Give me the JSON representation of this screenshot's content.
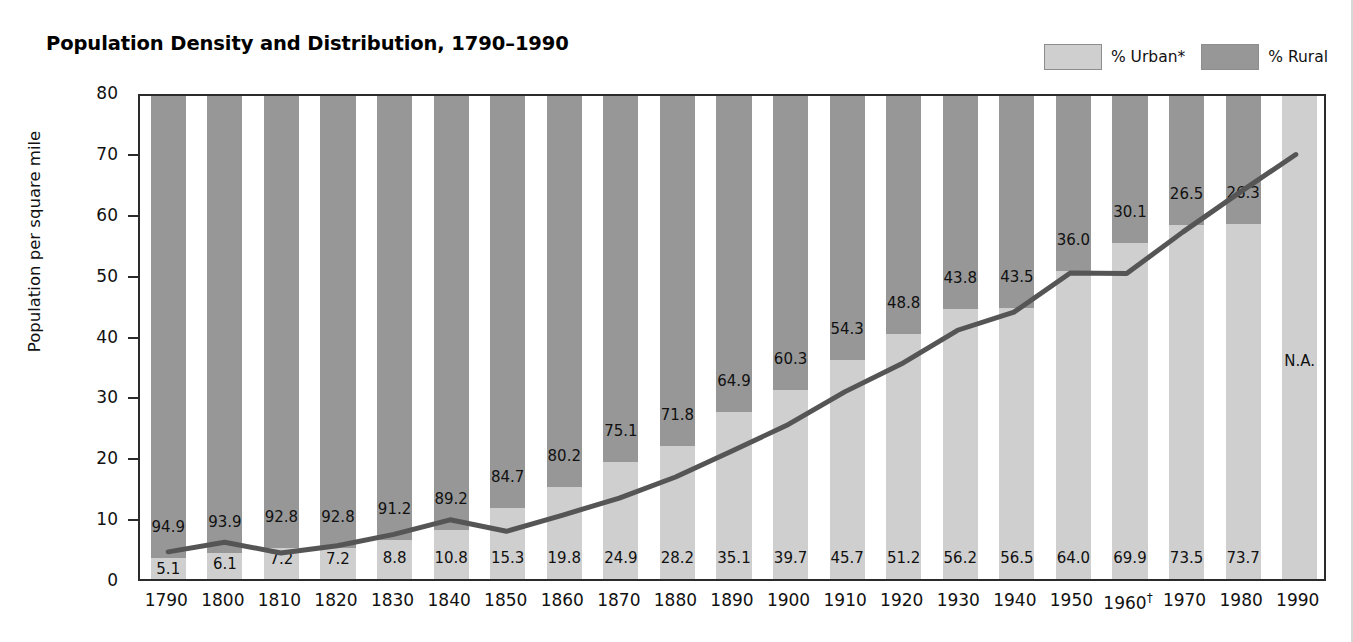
{
  "title": "Population Density and Distribution, 1790–1990",
  "legend": [
    {
      "label": "% Urban*",
      "color": "#cfcfcf",
      "name": "urban"
    },
    {
      "label": "% Rural",
      "color": "#979797",
      "name": "rural"
    }
  ],
  "axes": {
    "ylabel": "Population per square mile",
    "yticks": [
      "0",
      "10",
      "20",
      "30",
      "40",
      "50",
      "60",
      "70",
      "80"
    ],
    "ylim": [
      0,
      80
    ],
    "xlabel": ""
  },
  "na_label": "N.A.",
  "dagger": "†",
  "colors": {
    "urban": "#cfcfcf",
    "rural": "#979797",
    "line": "#555555",
    "frame": "#2b2b2b",
    "text": "#111111"
  },
  "chart_data": {
    "type": "bar",
    "title": "Population Density and Distribution, 1790–1990",
    "xlabel": "",
    "ylabel": "Population per square mile",
    "ylim": [
      0,
      80
    ],
    "grid": false,
    "legend_position": "top-right",
    "notes": [
      "* % Urban",
      "† 1960 footnote marker"
    ],
    "categories": [
      "1790",
      "1800",
      "1810",
      "1820",
      "1830",
      "1840",
      "1850",
      "1860",
      "1870",
      "1880",
      "1890",
      "1900",
      "1910",
      "1920",
      "1930",
      "1940",
      "1950",
      "1960",
      "1970",
      "1980",
      "1990"
    ],
    "series": [
      {
        "name": "% Urban*",
        "type": "bar-stacked-bottom",
        "color": "#cfcfcf",
        "values": [
          5.1,
          6.1,
          7.2,
          7.2,
          8.8,
          10.8,
          15.3,
          19.8,
          24.9,
          28.2,
          35.1,
          39.7,
          45.7,
          51.2,
          56.2,
          56.5,
          64.0,
          69.9,
          73.5,
          73.7,
          null
        ],
        "labels": [
          "5.1",
          "6.1",
          "7.2",
          "7.2",
          "8.8",
          "10.8",
          "15.3",
          "19.8",
          "24.9",
          "28.2",
          "35.1",
          "39.7",
          "45.7",
          "51.2",
          "56.2",
          "56.5",
          "64.0",
          "69.9",
          "73.5",
          "73.7",
          "N.A."
        ]
      },
      {
        "name": "% Rural",
        "type": "bar-stacked-top",
        "color": "#979797",
        "values": [
          94.9,
          93.9,
          92.8,
          92.8,
          91.2,
          89.2,
          84.7,
          80.2,
          75.1,
          71.8,
          64.9,
          60.3,
          54.3,
          48.8,
          43.8,
          43.5,
          36.0,
          30.1,
          26.5,
          26.3,
          null
        ],
        "labels": [
          "94.9",
          "93.9",
          "92.8",
          "92.8",
          "91.2",
          "89.2",
          "84.7",
          "80.2",
          "75.1",
          "71.8",
          "64.9",
          "60.3",
          "54.3",
          "48.8",
          "43.8",
          "43.5",
          "36.0",
          "30.1",
          "26.5",
          "26.3",
          ""
        ]
      },
      {
        "name": "Population per square mile",
        "type": "line",
        "color": "#555555",
        "values": [
          4.5,
          6.1,
          4.3,
          5.5,
          7.4,
          9.8,
          7.9,
          10.6,
          13.4,
          16.9,
          21.2,
          25.6,
          31.0,
          35.6,
          41.2,
          44.2,
          50.7,
          50.6,
          57.5,
          64.0,
          70.3
        ]
      }
    ]
  }
}
